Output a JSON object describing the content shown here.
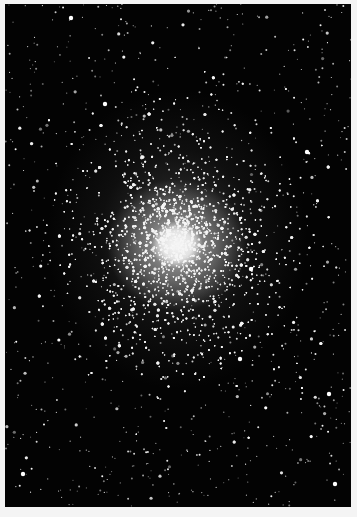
{
  "image": {
    "subject": "globular star cluster photograph",
    "style": "black and white astronomical photo",
    "background_color": "#030303",
    "border_color": "#f4f4f4",
    "core_center": [
      177,
      245
    ],
    "core_color": "#f2f2f2",
    "star_color": "#ffffff"
  }
}
